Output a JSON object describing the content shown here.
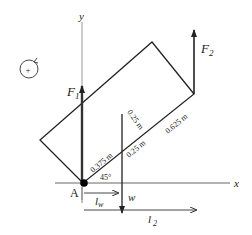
{
  "diagram": {
    "axes": {
      "x_label": "x",
      "y_label": "y"
    },
    "point_label": "A",
    "forces": {
      "F1": {
        "label": "F",
        "subscript": "1"
      },
      "F2": {
        "label": "F",
        "subscript": "2"
      },
      "w": {
        "label": "w"
      }
    },
    "moment_sign": "+",
    "dimensions": {
      "d1": "0.375 m",
      "d2": "0.25 m",
      "d3": "0.625 m",
      "d4": "0.25 m",
      "angle": "45°"
    },
    "lever_arms": {
      "lw": {
        "label": "l",
        "subscript": "w"
      },
      "l2": {
        "label": "l",
        "subscript": "2"
      }
    }
  }
}
